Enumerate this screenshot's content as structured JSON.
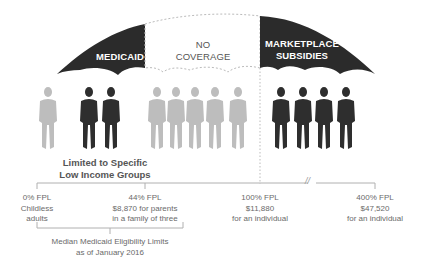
{
  "umbrella": {
    "segments": [
      {
        "id": "medicaid",
        "label": "MEDICAID",
        "style": "filled",
        "color": "#2b2b2b"
      },
      {
        "id": "no-coverage",
        "label_line1": "NO",
        "label_line2": "COVERAGE",
        "style": "dashed-outline",
        "color": "#bbbbbb"
      },
      {
        "id": "marketplace",
        "label_line1": "MARKETPLACE",
        "label_line2": "SUBSIDIES",
        "style": "filled",
        "color": "#2b2b2b"
      }
    ]
  },
  "people": {
    "colors": {
      "covered": "#2e2e2e",
      "uncovered": "#bdbdbd"
    },
    "figures": [
      {
        "x": 48,
        "status": "uncovered"
      },
      {
        "x": 89,
        "status": "covered"
      },
      {
        "x": 111,
        "status": "covered"
      },
      {
        "x": 157,
        "status": "uncovered"
      },
      {
        "x": 176,
        "status": "uncovered"
      },
      {
        "x": 195,
        "status": "uncovered"
      },
      {
        "x": 215,
        "status": "uncovered"
      },
      {
        "x": 238,
        "status": "uncovered"
      },
      {
        "x": 281,
        "status": "covered"
      },
      {
        "x": 303,
        "status": "covered"
      },
      {
        "x": 324,
        "status": "covered"
      },
      {
        "x": 346,
        "status": "covered"
      }
    ]
  },
  "group_caption": {
    "line1": "Limited to Specific",
    "line2": "Low Income Groups"
  },
  "scale": {
    "break_symbol": "//",
    "ticks": [
      {
        "line1": "0% FPL",
        "line2": "Childless",
        "line3": "adults"
      },
      {
        "line1": "44% FPL",
        "line2": "$8,870 for parents",
        "line3": "in a family of three"
      },
      {
        "line1": "100% FPL",
        "line2": "$11,880",
        "line3": "for an individual"
      },
      {
        "line1": "400% FPL",
        "line2": "$47,520",
        "line3": "for an individual"
      }
    ]
  },
  "median_note": {
    "line1": "Median Medicaid Eligibility Limits",
    "line2": "as of January 2016"
  }
}
